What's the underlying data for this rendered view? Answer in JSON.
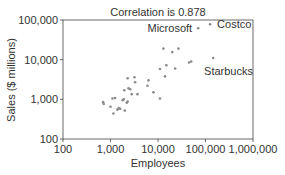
{
  "chart_data": {
    "type": "scatter",
    "title": "Correlation is 0.878",
    "xlabel": "Employees",
    "ylabel": "Sales ($ millions)",
    "xscale": "log",
    "yscale": "log",
    "xlim": [
      100,
      1000000
    ],
    "ylim": [
      100,
      100000
    ],
    "xticks": [
      100,
      1000,
      10000,
      100000,
      1000000
    ],
    "xtick_labels": [
      "100",
      "1,000",
      "10,000",
      "100,000",
      "1,000,000"
    ],
    "yticks": [
      100,
      1000,
      10000,
      100000
    ],
    "ytick_labels": [
      "100",
      "1,000",
      "10,000",
      "100,000"
    ],
    "grid": false,
    "legend": null,
    "marker_color": "#8a8a8a",
    "annotations": [
      {
        "label": "Microsoft",
        "x": 70000,
        "y": 62000,
        "anchor": "end"
      },
      {
        "label": "Costco",
        "x": 125000,
        "y": 78000,
        "anchor": "start"
      },
      {
        "label": "Starbucks",
        "x": 145000,
        "y": 11000,
        "anchor": "below"
      }
    ],
    "points": [
      {
        "x": 700,
        "y": 850
      },
      {
        "x": 720,
        "y": 760
      },
      {
        "x": 1000,
        "y": 650
      },
      {
        "x": 1100,
        "y": 1050
      },
      {
        "x": 1150,
        "y": 440
      },
      {
        "x": 1250,
        "y": 1080
      },
      {
        "x": 1400,
        "y": 550
      },
      {
        "x": 1500,
        "y": 600
      },
      {
        "x": 1600,
        "y": 580
      },
      {
        "x": 1800,
        "y": 950
      },
      {
        "x": 1900,
        "y": 1000
      },
      {
        "x": 1950,
        "y": 1700
      },
      {
        "x": 2000,
        "y": 520
      },
      {
        "x": 2200,
        "y": 820
      },
      {
        "x": 2300,
        "y": 880
      },
      {
        "x": 2300,
        "y": 3400
      },
      {
        "x": 2400,
        "y": 1900
      },
      {
        "x": 2600,
        "y": 1800
      },
      {
        "x": 2800,
        "y": 1350
      },
      {
        "x": 3200,
        "y": 3600
      },
      {
        "x": 3300,
        "y": 2700
      },
      {
        "x": 3700,
        "y": 1350
      },
      {
        "x": 6000,
        "y": 2200
      },
      {
        "x": 6300,
        "y": 3000
      },
      {
        "x": 8000,
        "y": 1500
      },
      {
        "x": 11000,
        "y": 1050
      },
      {
        "x": 11000,
        "y": 5800
      },
      {
        "x": 13000,
        "y": 19000
      },
      {
        "x": 14000,
        "y": 3800
      },
      {
        "x": 15000,
        "y": 7200
      },
      {
        "x": 20000,
        "y": 15500
      },
      {
        "x": 23000,
        "y": 6000
      },
      {
        "x": 27000,
        "y": 19000
      },
      {
        "x": 45000,
        "y": 8500
      },
      {
        "x": 50000,
        "y": 9000
      },
      {
        "x": 70000,
        "y": 62000,
        "name": "Microsoft"
      },
      {
        "x": 125000,
        "y": 78000,
        "name": "Costco"
      },
      {
        "x": 145000,
        "y": 11000,
        "name": "Starbucks"
      }
    ]
  }
}
